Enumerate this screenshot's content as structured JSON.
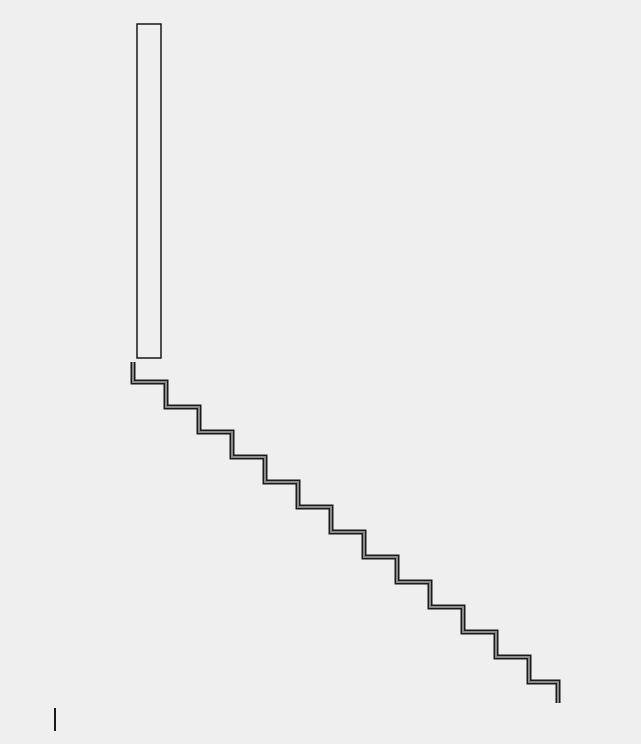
{
  "diagram": {
    "background": "#efefef",
    "stroke_color": "#1a1a1a",
    "fill_color": "#8a8a8a",
    "tall_rectangle": {
      "x": 137,
      "y": 24,
      "width": 24,
      "height": 334
    },
    "staircase": {
      "start_x": 133,
      "start_y": 362,
      "first_riser": 20,
      "step_width": 33,
      "step_height": 25,
      "step_count": 13,
      "end_x": 558,
      "end_y": 703
    },
    "tick_mark": {
      "x": 55,
      "y1": 708,
      "y2": 731
    }
  }
}
